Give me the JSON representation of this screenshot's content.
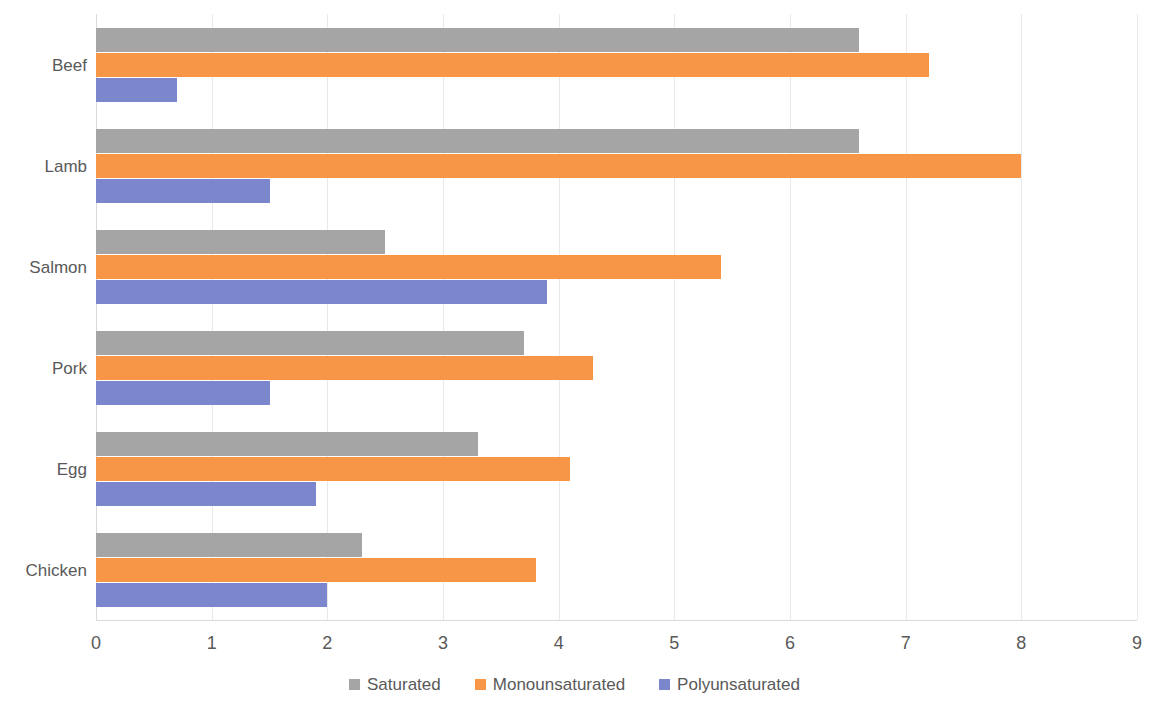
{
  "chart_data": {
    "type": "bar",
    "orientation": "horizontal",
    "title": "",
    "subtitle": "",
    "xlabel": "",
    "ylabel": "",
    "xlim": [
      0,
      9
    ],
    "ylim": null,
    "grid": true,
    "grid_axis": "x",
    "legend_position": "bottom",
    "xticks": [
      "0",
      "1",
      "2",
      "3",
      "4",
      "5",
      "6",
      "7",
      "8",
      "9"
    ],
    "categories": [
      "Beef",
      "Lamb",
      "Salmon",
      "Pork",
      "Egg",
      "Chicken"
    ],
    "series": [
      {
        "name": "Saturated",
        "color": "#a5a5a5",
        "values": [
          6.6,
          6.6,
          2.5,
          3.7,
          3.3,
          2.3
        ]
      },
      {
        "name": "Monounsaturated",
        "color": "#f79646",
        "values": [
          7.2,
          8.0,
          5.4,
          4.3,
          4.1,
          3.8
        ]
      },
      {
        "name": "Polyunsaturated",
        "color": "#7b86cc",
        "values": [
          0.7,
          1.5,
          3.9,
          1.5,
          1.9,
          2.0
        ]
      }
    ]
  },
  "legend": {
    "items": [
      {
        "label": "Saturated",
        "color": "#a5a5a5",
        "key": "saturated"
      },
      {
        "label": "Monounsaturated",
        "color": "#f79646",
        "key": "monounsaturated"
      },
      {
        "label": "Polyunsaturated",
        "color": "#7b86cc",
        "key": "polyunsaturated"
      }
    ]
  },
  "colors": {
    "saturated": "#a5a5a5",
    "monounsaturated": "#f79646",
    "polyunsaturated": "#7b86cc",
    "grid": "#e9e9e9",
    "text": "#595959",
    "background": "#ffffff"
  }
}
